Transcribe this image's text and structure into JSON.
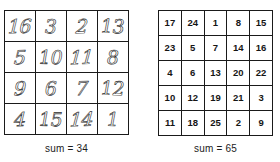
{
  "figure": {
    "background_color": "#ffffff",
    "line_color": "#1a1a1a",
    "text_color": "#151515"
  },
  "chart_data": [
    {
      "type": "table",
      "name": "durer-magic-square",
      "title": "",
      "order": 4,
      "style": "handwritten-outline",
      "rows": [
        [
          "16",
          "3",
          "2",
          "13"
        ],
        [
          "5",
          "10",
          "11",
          "8"
        ],
        [
          "9",
          "6",
          "7",
          "12"
        ],
        [
          "4",
          "15",
          "14",
          "1"
        ]
      ],
      "magic_constant": 34,
      "caption": "sum = 34"
    },
    {
      "type": "table",
      "name": "five-by-five-magic-square",
      "title": "",
      "order": 5,
      "style": "printed-sans",
      "rows": [
        [
          "17",
          "24",
          "1",
          "8",
          "15"
        ],
        [
          "23",
          "5",
          "7",
          "14",
          "16"
        ],
        [
          "4",
          "6",
          "13",
          "20",
          "22"
        ],
        [
          "10",
          "12",
          "19",
          "21",
          "3"
        ],
        [
          "11",
          "18",
          "25",
          "2",
          "9"
        ]
      ],
      "magic_constant": 65,
      "caption": "sum = 65"
    }
  ],
  "left_square": {
    "caption": "sum = 34",
    "rows": [
      [
        "16",
        "3",
        "2",
        "13"
      ],
      [
        "5",
        "10",
        "11",
        "8"
      ],
      [
        "9",
        "6",
        "7",
        "12"
      ],
      [
        "4",
        "15",
        "14",
        "1"
      ]
    ]
  },
  "right_square": {
    "caption": "sum = 65",
    "rows": [
      [
        "17",
        "24",
        "1",
        "8",
        "15"
      ],
      [
        "23",
        "5",
        "7",
        "14",
        "16"
      ],
      [
        "4",
        "6",
        "13",
        "20",
        "22"
      ],
      [
        "10",
        "12",
        "19",
        "21",
        "3"
      ],
      [
        "11",
        "18",
        "25",
        "2",
        "9"
      ]
    ]
  }
}
